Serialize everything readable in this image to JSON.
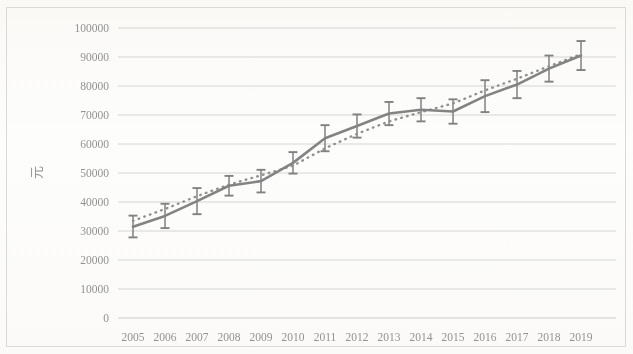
{
  "chart_data": {
    "type": "line",
    "title": "",
    "xlabel": "",
    "ylabel": "元",
    "categories": [
      "2005",
      "2006",
      "2007",
      "2008",
      "2009",
      "2010",
      "2011",
      "2012",
      "2013",
      "2014",
      "2015",
      "2016",
      "2017",
      "2018",
      "2019"
    ],
    "ylim": [
      0,
      100000
    ],
    "ytick_step": 10000,
    "yticks": [
      "0",
      "10000",
      "20000",
      "30000",
      "40000",
      "50000",
      "60000",
      "70000",
      "80000",
      "90000",
      "100000"
    ],
    "grid": "horizontal",
    "legend": "none",
    "series": [
      {
        "name": "实际值",
        "style": "solid",
        "color": "#7c7c7c",
        "has_error_bars": true,
        "values": [
          31500,
          35200,
          40300,
          45600,
          47200,
          53500,
          62000,
          66200,
          70500,
          71800,
          71200,
          76500,
          80500,
          86000,
          90500
        ],
        "error_low": [
          27800,
          31000,
          35800,
          42200,
          43300,
          49800,
          57500,
          62200,
          66500,
          67800,
          67000,
          71000,
          75800,
          81500,
          85500
        ],
        "error_high": [
          35300,
          39400,
          44800,
          49000,
          51100,
          57200,
          66500,
          70200,
          74500,
          75800,
          75400,
          82000,
          85200,
          90500,
          95500
        ]
      },
      {
        "name": "拟合值",
        "style": "dotted",
        "color": "#8a8a8a",
        "has_error_bars": false,
        "values": [
          33500,
          37600,
          42000,
          46000,
          49200,
          52500,
          58500,
          63500,
          67800,
          71000,
          74000,
          78500,
          82500,
          86800,
          91000
        ]
      }
    ]
  },
  "axis": {
    "y_title": "元"
  }
}
